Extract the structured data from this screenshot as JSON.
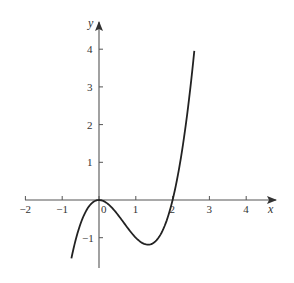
{
  "chart_data": {
    "type": "line",
    "title": "",
    "xlabel": "x",
    "ylabel": "y",
    "function": "y = x^3 - 2x^2",
    "xlim": [
      -2,
      4.8
    ],
    "ylim": [
      -1.8,
      4.6
    ],
    "x_ticks": [
      -2,
      -1,
      0,
      1,
      2,
      3,
      4
    ],
    "x_tick_labels": [
      "−2",
      "−1",
      "0",
      "1",
      "2",
      "3",
      "4"
    ],
    "y_ticks": [
      -1,
      1,
      2,
      3,
      4
    ],
    "y_tick_labels": [
      "−1",
      "1",
      "2",
      "3",
      "4"
    ],
    "grid": false,
    "legend": null,
    "series": [
      {
        "name": "curve",
        "x_range": [
          -0.75,
          2.59
        ],
        "points": [
          [
            -0.75,
            -1.547
          ],
          [
            -0.5,
            -0.625
          ],
          [
            -0.25,
            -0.141
          ],
          [
            0,
            0
          ],
          [
            0.25,
            -0.109
          ],
          [
            0.5,
            -0.375
          ],
          [
            0.75,
            -0.703
          ],
          [
            1,
            -1
          ],
          [
            1.333,
            -1.185
          ],
          [
            1.5,
            -1.125
          ],
          [
            1.75,
            -0.766
          ],
          [
            2,
            0
          ],
          [
            2.25,
            1.266
          ],
          [
            2.5,
            3.125
          ],
          [
            2.59,
            4.0
          ]
        ],
        "annotations": {
          "roots": [
            0,
            2
          ],
          "local_max": [
            0,
            0
          ],
          "local_min": [
            1.333,
            -1.185
          ]
        }
      }
    ],
    "color": "#222222"
  }
}
